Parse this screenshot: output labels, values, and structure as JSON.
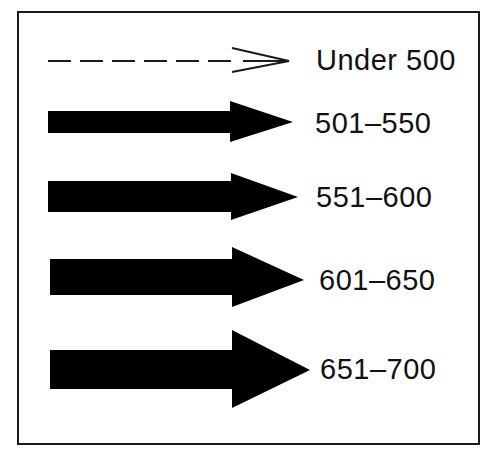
{
  "legend": {
    "colors": {
      "frame": "#1a1a1a",
      "arrow": "#000000",
      "text": "#111111",
      "background": "#ffffff"
    },
    "items": [
      {
        "label": "Under 500",
        "arrow_style": "dashed-open",
        "icon": "dashed-arrow-icon"
      },
      {
        "label": "501–550",
        "arrow_style": "solid",
        "icon": "solid-arrow-icon",
        "thickness": "thin"
      },
      {
        "label": "551–600",
        "arrow_style": "solid",
        "icon": "solid-arrow-icon",
        "thickness": "medium"
      },
      {
        "label": "601–650",
        "arrow_style": "solid",
        "icon": "solid-arrow-icon",
        "thickness": "thick"
      },
      {
        "label": "651–700",
        "arrow_style": "solid",
        "icon": "solid-arrow-icon",
        "thickness": "thickest"
      }
    ]
  }
}
